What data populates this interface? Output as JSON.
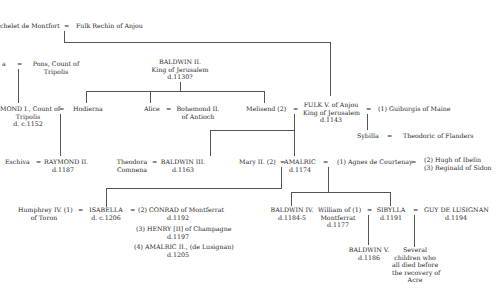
{
  "diagram": {
    "type": "family-tree",
    "marriage_symbol": "=",
    "people": {
      "montfort": {
        "lines": [
          "Bertrade de Montfort"
        ],
        "visible": "chelet de Montfort"
      },
      "fulk_rechin": {
        "lines": [
          "Fulk Rechin of Anjou"
        ]
      },
      "cecilia": {
        "lines": [
          "…a"
        ]
      },
      "pons": {
        "lines": [
          "Pons, Count of",
          "Tripolis"
        ]
      },
      "baldwin2": {
        "lines": [
          "BALDWIN II.",
          "King of Jerusalem",
          "d.1130?"
        ]
      },
      "raymond1": {
        "lines": [
          "RAYMOND I., Count of",
          "Tripolis",
          "d. c.1152"
        ]
      },
      "hodierna": {
        "lines": [
          "Hodierna"
        ]
      },
      "alice": {
        "lines": [
          "Alice"
        ]
      },
      "bohemond2": {
        "lines": [
          "Bohemond II.",
          "of Antioch"
        ]
      },
      "melisend": {
        "lines": [
          "Melisend (2)"
        ]
      },
      "fulk5": {
        "lines": [
          "FULK V. of Anjou",
          "King of Jerusalem",
          "d.1143"
        ]
      },
      "guiburgis": {
        "lines": [
          "(1) Guiburgis of Maine"
        ]
      },
      "sybilla_f": {
        "lines": [
          "Sybilla"
        ]
      },
      "theodoric": {
        "lines": [
          "Theodoric of Flanders"
        ]
      },
      "eschiva": {
        "lines": [
          "Eschiva"
        ]
      },
      "raymond2": {
        "lines": [
          "RAYMOND II.",
          "d.1187"
        ]
      },
      "theodora": {
        "lines": [
          "Theodora",
          "Comnena"
        ]
      },
      "baldwin3": {
        "lines": [
          "BALDWIN III.",
          "d.1163"
        ]
      },
      "mary2": {
        "lines": [
          "Mary II. (2)"
        ]
      },
      "amalric": {
        "lines": [
          "AMALRIC",
          "d.1174"
        ]
      },
      "agnes": {
        "lines": [
          "(1) Agnes de Courtenay"
        ]
      },
      "hugh_reginald": {
        "lines": [
          "(2) Hugh of Ibelin",
          "(3) Reginald of Sidon"
        ]
      },
      "humphrey": {
        "lines": [
          "Humphrey IV. (1)",
          "of Toron"
        ]
      },
      "isabella": {
        "lines": [
          "ISABELLA",
          "d. c.1206"
        ]
      },
      "conrad": {
        "lines": [
          "(2) CONRAD of Montferrat",
          "d.1192"
        ]
      },
      "henry": {
        "lines": [
          "(3) HENRY [II] of Champagne",
          "d.1197"
        ]
      },
      "amalric2": {
        "lines": [
          "(4) AMALRIC II., (de Lusignan)",
          "d.1205"
        ]
      },
      "baldwin4": {
        "lines": [
          "BALDWIN IV.",
          "d.1184-5"
        ]
      },
      "william": {
        "lines": [
          "William of (1)",
          "Montferrat",
          "d.1177"
        ]
      },
      "sibylla": {
        "lines": [
          "SIBYLLA",
          "d.1191"
        ]
      },
      "guy": {
        "lines": [
          "GUY DE LUSIGNAN",
          "d.1194"
        ]
      },
      "baldwin5": {
        "lines": [
          "BALDWIN V.",
          "d.1186"
        ]
      },
      "children": {
        "lines": [
          "Several",
          "children who",
          "all died before",
          "the recovery of",
          "Acre"
        ]
      }
    }
  },
  "text": {
    "montfort": "chelet de Montfort",
    "fulk_rechin": "Fulk Rechin of Anjou",
    "cecilia": "a",
    "pons1": "Pons, Count of",
    "pons2": "Tripolis",
    "b2_1": "BALDWIN II.",
    "b2_2": "King of Jerusalem",
    "b2_3": "d.1130?",
    "r1_1": "MOND I., Count of",
    "r1_2": "Tripolis",
    "r1_3": "d. c.1152",
    "hodierna": "Hodierna",
    "alice": "Alice",
    "bo1": "Bohemond II.",
    "bo2": "of Antioch",
    "melisend": "Melisend (2)",
    "f5_1": "FULK V. of Anjou",
    "f5_2": "King of Jerusalem",
    "f5_3": "d.1143",
    "guiburgis": "(1) Guiburgis of Maine",
    "sybilla_f": "Sybilla",
    "theodoric": "Theodoric of Flanders",
    "eschiva": "Eschiva",
    "r2_1": "RAYMOND II.",
    "r2_2": "d.1187",
    "th1": "Theodora",
    "th2": "Comnena",
    "b3_1": "BALDWIN III.",
    "b3_2": "d.1163",
    "mary2": "Mary II. (2)",
    "am1": "AMALRIC",
    "am2": "d.1174",
    "agnes": "(1) Agnes de Courtenay",
    "hr1": "(2) Hugh of Ibelin",
    "hr2": "(3) Reginald of Sidon",
    "hu1": "Humphrey IV. (1)",
    "hu2": "of Toron",
    "is1": "ISABELLA",
    "is2": "d. c.1206",
    "co1": "(2) CONRAD of Montferrat",
    "co2": "d.1192",
    "he1": "(3) HENRY [II] of Champagne",
    "he2": "d.1197",
    "a2_1": "(4) AMALRIC II., (de Lusignan)",
    "a2_2": "d.1205",
    "b4_1": "BALDWIN IV.",
    "b4_2": "d.1184-5",
    "wi1": "William of (1)",
    "wi2": "Montferrat",
    "wi3": "d.1177",
    "si1": "SIBYLLA",
    "si2": "d.1191",
    "gu1": "GUY DE LUSIGNAN",
    "gu2": "d.1194",
    "b5_1": "BALDWIN V.",
    "b5_2": "d.1186",
    "ch1": "Several",
    "ch2": "children who",
    "ch3": "all died before",
    "ch4": "the recovery of",
    "ch5": "Acre",
    "eq": "="
  }
}
